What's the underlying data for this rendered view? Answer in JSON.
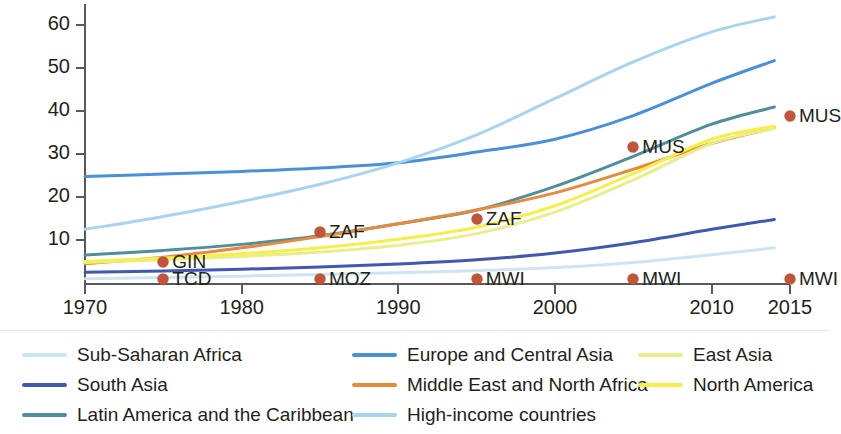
{
  "chart_data": {
    "type": "line",
    "title": "",
    "xlabel": "",
    "ylabel": "Gross enrollment rate (%)",
    "xlim": [
      1970,
      2015
    ],
    "ylim": [
      0,
      65
    ],
    "xticks": [
      1970,
      1980,
      1990,
      2000,
      2010,
      2015
    ],
    "yticks": [
      10,
      20,
      30,
      40,
      50,
      60
    ],
    "grid": false,
    "legend_position": "bottom",
    "x": [
      1970,
      1975,
      1980,
      1985,
      1990,
      1995,
      2000,
      2005,
      2010,
      2014
    ],
    "series": [
      {
        "name": "Sub-Saharan Africa",
        "color": "#cfe4f2",
        "values": [
          1.0,
          1.3,
          1.6,
          2.0,
          2.4,
          2.9,
          3.6,
          4.8,
          6.6,
          8.2
        ]
      },
      {
        "name": "South Asia",
        "color": "#4257b2",
        "values": [
          2.5,
          2.8,
          3.2,
          3.7,
          4.4,
          5.4,
          7.0,
          9.4,
          12.5,
          14.8
        ]
      },
      {
        "name": "Latin America and the Caribbean",
        "color": "#4f8e9c",
        "values": [
          6.5,
          7.6,
          9.0,
          11.0,
          13.8,
          17.0,
          22.5,
          29.5,
          37.0,
          41.0
        ]
      },
      {
        "name": "Europe and Central Asia",
        "color": "#4a90d9",
        "values": [
          24.8,
          25.4,
          26.0,
          26.8,
          28.0,
          30.5,
          33.5,
          39.0,
          46.5,
          51.8
        ]
      },
      {
        "name": "Middle East and North Africa",
        "color": "#e88a3c",
        "values": [
          4.5,
          6.0,
          8.2,
          10.8,
          13.8,
          17.0,
          21.0,
          26.5,
          32.5,
          36.2
        ]
      },
      {
        "name": "High-income countries",
        "color": "#a9d4ef",
        "values": [
          12.5,
          15.5,
          19.0,
          23.0,
          28.0,
          34.5,
          43.0,
          51.5,
          58.5,
          62.0
        ]
      },
      {
        "name": "East Asia",
        "color": "#e9ee8c",
        "values": [
          4.8,
          5.4,
          6.2,
          7.2,
          8.8,
          11.5,
          16.5,
          24.0,
          32.5,
          36.0
        ]
      },
      {
        "name": "North America",
        "color": "#f6ef4a",
        "values": [
          5.0,
          5.8,
          6.8,
          8.2,
          10.2,
          13.0,
          18.0,
          25.5,
          33.5,
          36.5
        ]
      }
    ],
    "markers": [
      {
        "code": "GIN",
        "year": 1975,
        "value": 5.0,
        "label_side": "right"
      },
      {
        "code": "TCD",
        "year": 1975,
        "value": 1.0,
        "label_side": "right"
      },
      {
        "code": "MOZ",
        "year": 1985,
        "value": 1.0,
        "label_side": "right"
      },
      {
        "code": "ZAF",
        "year": 1985,
        "value": 11.8,
        "label_side": "right"
      },
      {
        "code": "ZAF",
        "year": 1995,
        "value": 15.0,
        "label_side": "right"
      },
      {
        "code": "MWI",
        "year": 1995,
        "value": 1.0,
        "label_side": "right"
      },
      {
        "code": "MUS",
        "year": 2005,
        "value": 31.8,
        "label_side": "right"
      },
      {
        "code": "MWI",
        "year": 2005,
        "value": 1.0,
        "label_side": "right"
      },
      {
        "code": "MUS",
        "year": 2015,
        "value": 39.0,
        "label_side": "right"
      },
      {
        "code": "MWI",
        "year": 2015,
        "value": 1.0,
        "label_side": "right"
      }
    ],
    "marker_color": "#c1553a"
  },
  "legend": {
    "columns": [
      {
        "items": [
          {
            "label": "Sub-Saharan Africa",
            "color": "#cfe4f2"
          },
          {
            "label": "South Asia",
            "color": "#4257b2"
          },
          {
            "label": "Latin America and the Caribbean",
            "color": "#4f8e9c"
          }
        ]
      },
      {
        "items": [
          {
            "label": "Europe and Central Asia",
            "color": "#4a90d9"
          },
          {
            "label": "Middle East and North Africa",
            "color": "#e88a3c"
          },
          {
            "label": "High-income countries",
            "color": "#a9d4ef"
          }
        ]
      },
      {
        "items": [
          {
            "label": "East Asia",
            "color": "#e9ee8c"
          },
          {
            "label": "North America",
            "color": "#f6ef4a"
          }
        ]
      }
    ]
  }
}
